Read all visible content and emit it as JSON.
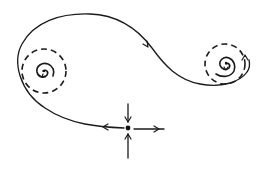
{
  "figure": {
    "type": "phase-portrait",
    "colors": {
      "background": "#ffffff",
      "ink": "#1a1a1a"
    },
    "elements": {
      "left_focus": {
        "kind": "spiral-focus",
        "center": [
          44,
          71
        ],
        "limit_cycle": "dashed-circle",
        "limit_cycle_radius": 22
      },
      "right_focus": {
        "kind": "spiral-focus",
        "center": [
          225,
          64
        ],
        "limit_cycle": "dashed-circle",
        "limit_cycle_radius": 20
      },
      "saddle": {
        "kind": "saddle-point",
        "center": [
          128,
          128
        ],
        "incoming": [
          "top",
          "bottom"
        ],
        "outgoing": [
          "left",
          "right"
        ]
      },
      "trajectory": {
        "kind": "separatrix",
        "from": "saddle",
        "path": "left, up around left focus, over top, down to wrap under right focus",
        "arrows": [
          "near-saddle-left",
          "top-descending"
        ]
      }
    }
  }
}
